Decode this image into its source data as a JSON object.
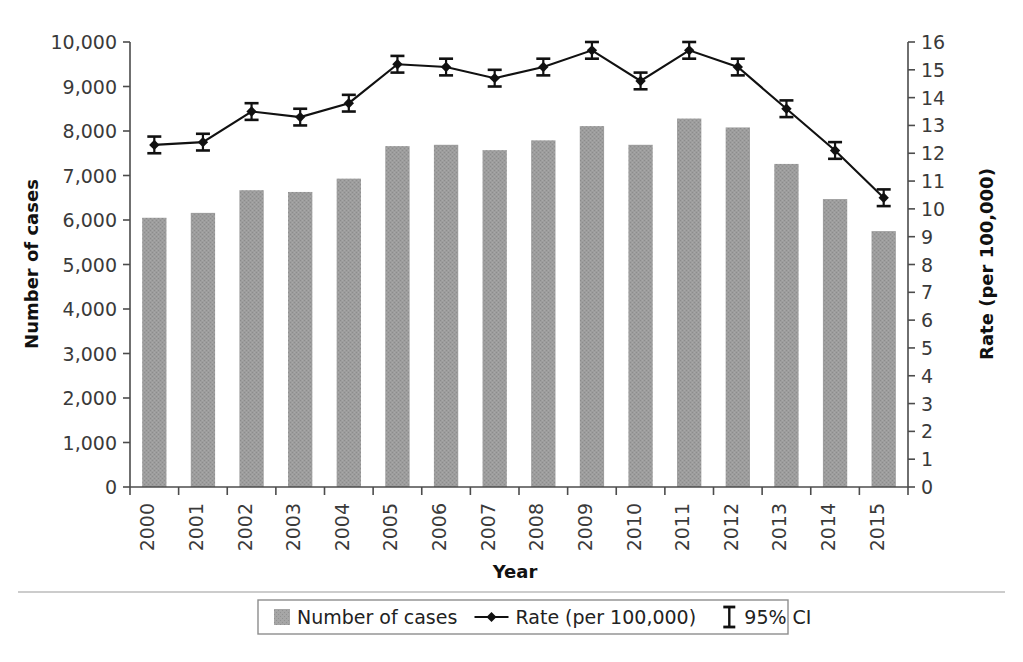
{
  "chart_data": {
    "type": "bar",
    "title": "",
    "xlabel": "Year",
    "ylabel": "Number of cases",
    "y2label": "Rate (per 100,000)",
    "categories": [
      "2000",
      "2001",
      "2002",
      "2003",
      "2004",
      "2005",
      "2006",
      "2007",
      "2008",
      "2009",
      "2010",
      "2011",
      "2012",
      "2013",
      "2014",
      "2015"
    ],
    "ylim": [
      0,
      10000
    ],
    "y2lim": [
      0,
      16
    ],
    "ytick_labels": [
      "0",
      "1,000",
      "2,000",
      "3,000",
      "4,000",
      "5,000",
      "6,000",
      "7,000",
      "8,000",
      "9,000",
      "10,000"
    ],
    "ytick_values": [
      0,
      1000,
      2000,
      3000,
      4000,
      5000,
      6000,
      7000,
      8000,
      9000,
      10000
    ],
    "y2tick_labels": [
      "0",
      "1",
      "2",
      "3",
      "4",
      "5",
      "6",
      "7",
      "8",
      "9",
      "10",
      "11",
      "12",
      "13",
      "14",
      "15",
      "16"
    ],
    "y2tick_values": [
      0,
      1,
      2,
      3,
      4,
      5,
      6,
      7,
      8,
      9,
      10,
      11,
      12,
      13,
      14,
      15,
      16
    ],
    "grid": false,
    "legend_position": "bottom",
    "series": [
      {
        "name": "Number of cases",
        "type": "bar",
        "axis": "left",
        "color": "#9a9a9a",
        "values": [
          6050,
          6160,
          6670,
          6630,
          6930,
          7660,
          7690,
          7570,
          7790,
          8110,
          7690,
          8280,
          8080,
          7260,
          6470,
          5750
        ]
      },
      {
        "name": "Rate (per 100,000)",
        "type": "line",
        "axis": "right",
        "color": "#111111",
        "marker": "diamond",
        "values": [
          12.3,
          12.4,
          13.5,
          13.3,
          13.8,
          15.2,
          15.1,
          14.7,
          15.1,
          15.7,
          14.6,
          15.7,
          15.1,
          13.6,
          12.1,
          10.4
        ],
        "ci_lower": [
          12.0,
          12.1,
          13.2,
          13.0,
          13.5,
          14.9,
          14.8,
          14.4,
          14.8,
          15.4,
          14.3,
          15.4,
          14.8,
          13.3,
          11.8,
          10.1
        ],
        "ci_upper": [
          12.6,
          12.7,
          13.8,
          13.6,
          14.1,
          15.5,
          15.4,
          15.0,
          15.4,
          16.0,
          14.9,
          16.0,
          15.4,
          13.9,
          12.4,
          10.7
        ]
      }
    ]
  },
  "axes": {
    "left_title": "Number of cases",
    "right_title": "Rate (per 100,000)",
    "bottom_title": "Year"
  },
  "legend": {
    "items": [
      {
        "label": "Number of cases",
        "marker": "swatch",
        "color": "#9a9a9a"
      },
      {
        "label": "Rate (per 100,000)",
        "marker": "line-diamond",
        "color": "#111111"
      },
      {
        "label": "95% CI",
        "marker": "error-bar",
        "color": "#111111"
      }
    ]
  }
}
